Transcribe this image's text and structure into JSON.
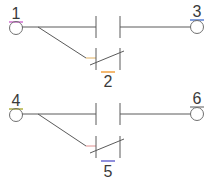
{
  "diagram": {
    "type": "switch-circuit",
    "line_color": "#5a5a5a",
    "circuits": [
      {
        "id": "circuit-a",
        "left_node": {
          "label": "1",
          "underline_color": "#d070d0",
          "x": 16,
          "y": 25
        },
        "right_node": {
          "label": "3",
          "underline_color": "#5a7fd0",
          "x": 196,
          "y": 25
        },
        "branch_contact": {
          "label": "2",
          "underline_color": "#f0a040",
          "x": 108,
          "y": 80
        },
        "offset_y": 0
      },
      {
        "id": "circuit-b",
        "left_node": {
          "label": "4",
          "underline_color": "#b0b040",
          "x": 16,
          "y": 113
        },
        "right_node": {
          "label": "6",
          "underline_color": "#909090",
          "x": 196,
          "y": 113
        },
        "branch_contact": {
          "label": "5",
          "underline_color": "#6a6ad0",
          "x": 108,
          "y": 168
        },
        "offset_y": 88
      }
    ]
  }
}
